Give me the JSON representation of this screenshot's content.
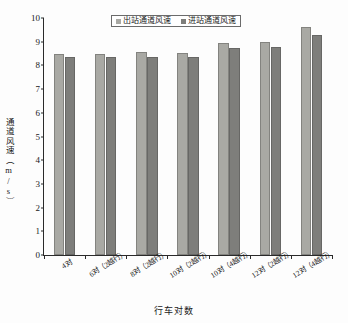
{
  "chart_data": {
    "type": "bar",
    "title": "",
    "xlabel": "行车对数",
    "ylabel": "通道风速（m/s）",
    "ylim": [
      0,
      10
    ],
    "ytick_step": 1,
    "yticks": [
      "10",
      "9",
      "8",
      "7",
      "6",
      "5",
      "4",
      "3",
      "2",
      "1",
      "0"
    ],
    "grid": false,
    "legend_position": "top-center",
    "categories": [
      "4对",
      "6对（2越行）",
      "8对（2越行）",
      "10对（2越行）",
      "10对（4越行）",
      "12对（2越行）",
      "12对（4越行）"
    ],
    "series": [
      {
        "name": "出站通道风速",
        "color": "#a9a9a4",
        "values": [
          8.5,
          8.5,
          8.57,
          8.54,
          8.96,
          9.0,
          9.64
        ]
      },
      {
        "name": "进站通道风速",
        "color": "#7e7e7b",
        "values": [
          8.34,
          8.36,
          8.34,
          8.34,
          8.72,
          8.79,
          9.3
        ]
      }
    ]
  },
  "axis": {
    "y_title": "通道风速（m/s）",
    "x_title": "行车对数"
  },
  "colors": {
    "series_out": "#a9a9a4",
    "series_in": "#7e7e7b",
    "axis": "#2a2a2a",
    "background": "#fdfdfd"
  }
}
